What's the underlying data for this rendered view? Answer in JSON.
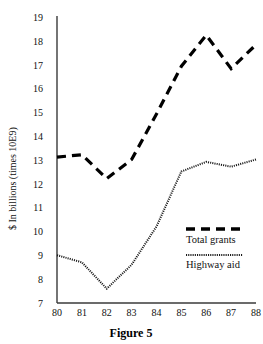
{
  "figure": {
    "caption": "Figure 5"
  },
  "chart_data": {
    "type": "line",
    "title": "",
    "subtitle": "",
    "xlabel": "",
    "ylabel": "$ In billions (times 10E9)",
    "categories": [
      "80",
      "81",
      "82",
      "83",
      "84",
      "85",
      "86",
      "87",
      "88"
    ],
    "x": [
      80,
      81,
      82,
      83,
      84,
      85,
      86,
      87,
      88
    ],
    "xlim": [
      80,
      88
    ],
    "ylim": [
      7,
      19
    ],
    "yticks": [
      7,
      8,
      9,
      10,
      11,
      12,
      13,
      14,
      15,
      16,
      17,
      18,
      19
    ],
    "xticks": [
      "80",
      "81",
      "82",
      "83",
      "84",
      "85",
      "86",
      "87",
      "88"
    ],
    "grid": false,
    "legend_position": "center-right",
    "series": [
      {
        "name": "Total grants",
        "style": "dashed",
        "color": "#000000",
        "values": [
          13.1,
          13.2,
          12.2,
          13.0,
          14.9,
          16.9,
          18.2,
          16.8,
          17.8
        ]
      },
      {
        "name": "Highway aid",
        "style": "dotted",
        "color": "#1a1a1a",
        "values": [
          9.0,
          8.7,
          7.6,
          8.6,
          10.2,
          12.5,
          12.9,
          12.7,
          13.0
        ]
      }
    ]
  },
  "legend": {
    "items": [
      {
        "label": "Total grants",
        "swatch": "dashed-line-swatch"
      },
      {
        "label": "Highway aid",
        "swatch": "dotted-line-swatch"
      }
    ]
  }
}
